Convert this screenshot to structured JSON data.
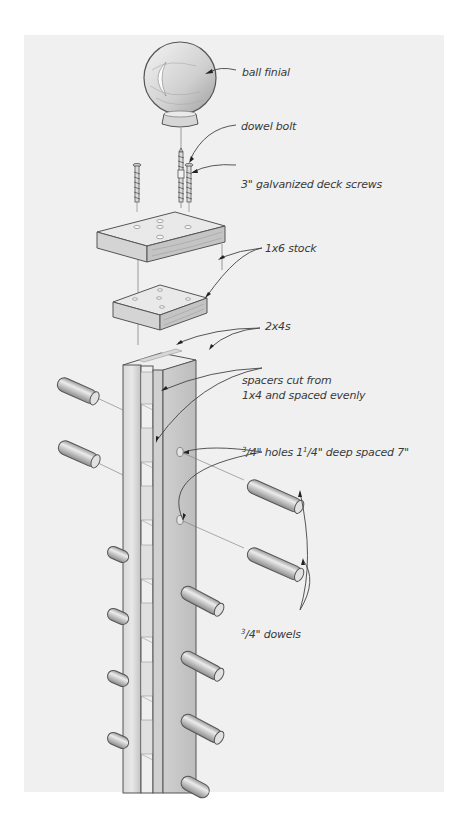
{
  "diagram": {
    "type": "exploded-assembly",
    "colors": {
      "page_background": "#ffffff",
      "panel_background": "#f0f0f0",
      "wood_light": "#e6e6e6",
      "wood_mid": "#cfcfcf",
      "wood_dark": "#a9a9a9",
      "outline": "#555555",
      "label_text": "#3a3a3a"
    },
    "labels": {
      "ball_finial": "ball finial",
      "dowel_bolt": "dowel bolt",
      "deck_screws": "3\" galvanized deck screws",
      "stock": "1x6 stock",
      "two_by_fours": "2x4s",
      "spacers_line1": "spacers cut from",
      "spacers_line2": "1x4 and spaced evenly",
      "holes_num": "3",
      "holes_text1": "/4\" holes 1",
      "holes_num2": "1",
      "holes_text2": "/4\" deep spaced 7\"",
      "dowels_num": "3",
      "dowels_text": "/4\" dowels"
    },
    "components": [
      {
        "name": "ball finial",
        "count": 1
      },
      {
        "name": "dowel bolt",
        "count": 1
      },
      {
        "name": "3\" galvanized deck screws",
        "count": 2
      },
      {
        "name": "1x6 stock",
        "count": 2
      },
      {
        "name": "2x4s",
        "count": 2
      },
      {
        "name": "spacers cut from 1x4",
        "count": "multiple"
      },
      {
        "name": "3/4\" dowels",
        "count": 12
      }
    ]
  }
}
